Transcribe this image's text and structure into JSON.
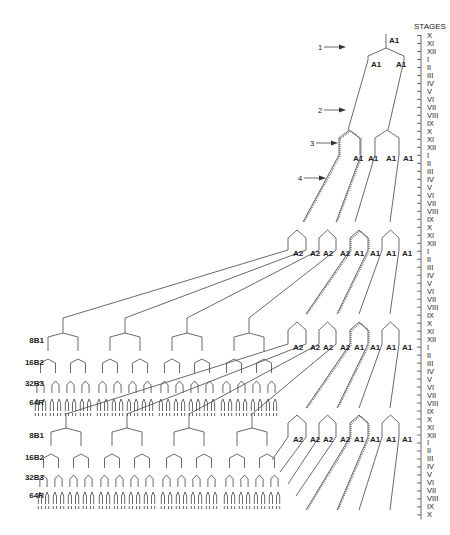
{
  "axis": {
    "title": "STAGES",
    "labels": [
      "X",
      "XI",
      "XII",
      "I",
      "II",
      "III",
      "IV",
      "V",
      "VI",
      "VII",
      "VIII",
      "IX",
      "X",
      "XI",
      "XII",
      "I",
      "II",
      "III",
      "IV",
      "V",
      "VI",
      "VII",
      "VIII",
      "IX",
      "X",
      "XI",
      "XII",
      "I",
      "II",
      "III",
      "IV",
      "V",
      "VI",
      "VII",
      "VIII",
      "IX",
      "X",
      "XI",
      "XII",
      "I",
      "II",
      "III",
      "IV",
      "V",
      "VI",
      "VII",
      "VIII",
      "IX",
      "X",
      "XI",
      "XII",
      "I",
      "II",
      "III",
      "IV",
      "V",
      "VI",
      "VII",
      "VIII",
      "IX",
      "X"
    ],
    "top_y": 38,
    "spacing": 7.99,
    "tick_x": 421,
    "label_x": 427
  },
  "arrows": [
    {
      "label": "1",
      "x": 330,
      "y": 47
    },
    {
      "label": "2",
      "x": 330,
      "y": 110
    },
    {
      "label": "3",
      "x": 322,
      "y": 143
    },
    {
      "label": "4",
      "x": 310,
      "y": 178
    }
  ],
  "rows": [
    {
      "y": 43,
      "labels": [
        {
          "text": "A1",
          "x": 389
        }
      ]
    },
    {
      "y": 67,
      "labels": [
        {
          "text": "A1",
          "x": 371
        },
        {
          "text": "A1",
          "x": 396
        }
      ]
    },
    {
      "y": 161,
      "labels": [
        {
          "text": "A1",
          "x": 353
        },
        {
          "text": "A1",
          "x": 368
        },
        {
          "text": "A1",
          "x": 386
        },
        {
          "text": "A1",
          "x": 403
        }
      ]
    },
    {
      "y": 256,
      "labels": [
        {
          "text": "A2",
          "x": 293
        },
        {
          "text": "A2",
          "x": 310
        },
        {
          "text": "A2",
          "x": 323
        },
        {
          "text": "A2",
          "x": 340
        },
        {
          "text": "A1",
          "x": 354
        },
        {
          "text": "A1",
          "x": 370
        },
        {
          "text": "A1",
          "x": 386
        },
        {
          "text": "A1",
          "x": 402
        }
      ]
    },
    {
      "y": 350,
      "labels": [
        {
          "text": "A2",
          "x": 293
        },
        {
          "text": "A2",
          "x": 310
        },
        {
          "text": "A2",
          "x": 323
        },
        {
          "text": "A2",
          "x": 340
        },
        {
          "text": "A1",
          "x": 354
        },
        {
          "text": "A1",
          "x": 370
        },
        {
          "text": "A1",
          "x": 386
        },
        {
          "text": "A1",
          "x": 402
        }
      ]
    },
    {
      "y": 442,
      "labels": [
        {
          "text": "A2",
          "x": 293
        },
        {
          "text": "A2",
          "x": 310
        },
        {
          "text": "A2",
          "x": 323
        },
        {
          "text": "A2",
          "x": 340
        },
        {
          "text": "A1",
          "x": 354
        },
        {
          "text": "A1",
          "x": 370
        },
        {
          "text": "A1",
          "x": 386
        },
        {
          "text": "A1",
          "x": 402
        }
      ]
    }
  ],
  "tree_blocks": [
    {
      "labels": {
        "b1": "8B1",
        "b2": "16B2",
        "b3": "32B3",
        "r": "64R"
      },
      "y_b1": 343,
      "y_b2": 365,
      "y_b3": 386,
      "y_r": 405,
      "top_y": 318
    },
    {
      "labels": {
        "b1": "8B1",
        "b2": "16B2",
        "b3": "32B3",
        "r": "64R"
      },
      "y_b1": 438,
      "y_b2": 460,
      "y_b3": 480,
      "y_r": 498,
      "top_y": 414
    }
  ]
}
